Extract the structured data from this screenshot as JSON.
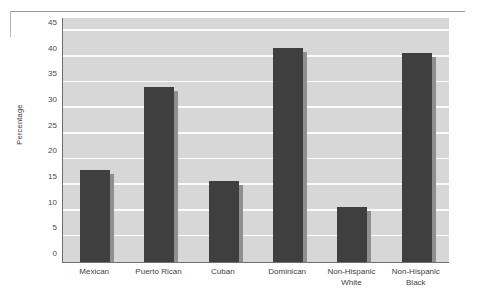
{
  "chart_data": {
    "type": "bar",
    "title": "",
    "xlabel": "",
    "ylabel": "Percentage",
    "categories": [
      "Mexican",
      "Puerto Rican",
      "Cuban",
      "Dominican",
      "Non-Hispanic\nWhite",
      "Non-Hispanic\nBlack"
    ],
    "values": [
      18,
      34,
      15.7,
      41.7,
      10.8,
      40.6
    ],
    "ylim": [
      0,
      47.5
    ],
    "yticks": [
      0,
      5,
      10,
      15,
      20,
      25,
      30,
      35,
      40,
      45
    ],
    "ytick_labels": [
      "0",
      "5",
      "10",
      "15",
      "20",
      "25",
      "30",
      "35",
      "40",
      "45"
    ],
    "grid": true,
    "legend": false,
    "series": [
      {
        "name": "Percentage",
        "values": [
          18,
          34,
          15.7,
          41.7,
          10.8,
          40.6
        ]
      }
    ],
    "colors": {
      "bar": "#3f3f3f",
      "bar_shadow": "#8f8f8f",
      "plot_background": "#d7d7d7",
      "gridline": "#fbfbfb",
      "axis": "#6f6f6f",
      "text": "#3f3f3f"
    }
  }
}
